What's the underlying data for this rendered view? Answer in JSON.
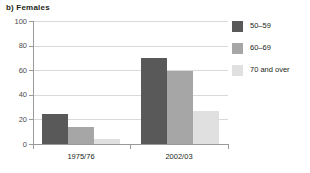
{
  "chart_data": {
    "type": "bar",
    "title": "b) Females",
    "xlabel": "",
    "ylabel": "",
    "categories": [
      "1975/76",
      "2002/03"
    ],
    "series": [
      {
        "name": "50–59",
        "values": [
          24,
          70
        ],
        "color": "#595959"
      },
      {
        "name": "60–69",
        "values": [
          14,
          59
        ],
        "color": "#a6a6a6"
      },
      {
        "name": "70 and over",
        "values": [
          4,
          27
        ],
        "color": "#e0e0e0"
      }
    ],
    "ylim": [
      0,
      100
    ],
    "yticks": [
      0,
      20,
      40,
      60,
      80,
      100
    ],
    "ytick_labels": [
      "0",
      "20",
      "40",
      "60",
      "80",
      "100"
    ],
    "grid": true,
    "legend_position": "right"
  },
  "legend": {
    "items": [
      {
        "label": "50–59"
      },
      {
        "label": "60–69"
      },
      {
        "label": "70 and over"
      }
    ]
  },
  "axis": {
    "y_labels": [
      "100",
      "80",
      "60",
      "40",
      "20",
      "0"
    ],
    "x_labels": [
      "1975/76",
      "2002/03"
    ]
  }
}
